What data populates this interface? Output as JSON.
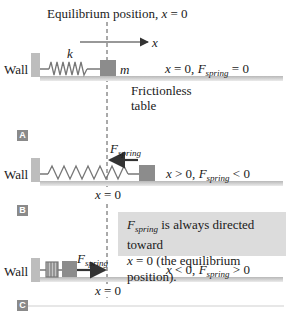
{
  "title": "Equilibrium position, x = 0",
  "title_parts": {
    "text": "Equilibrium position, ",
    "var": "x",
    "eq": " = 0"
  },
  "axis_label": "x",
  "panels": [
    {
      "id": "A",
      "spring_label": "k",
      "mass_label": "m",
      "wall_label": "Wall",
      "condition": {
        "lhs": "x",
        "lhs_rel": " = 0, ",
        "force": "F",
        "force_sub": "spring",
        "rhs": " = 0"
      },
      "table_label_line1": "Frictionless",
      "table_label_line2": "table"
    },
    {
      "id": "B",
      "wall_label": "Wall",
      "force_label": {
        "F": "F",
        "sub": "spring"
      },
      "condition": {
        "lhs": "x",
        "lhs_rel": " > 0, ",
        "force": "F",
        "force_sub": "spring",
        "rhs": " < 0"
      },
      "origin_label": {
        "var": "x",
        "eq": " = 0"
      }
    },
    {
      "id": "C",
      "wall_label": "Wall",
      "force_label": {
        "F": "F",
        "sub": "spring"
      },
      "condition": {
        "lhs": "x",
        "lhs_rel": " < 0, ",
        "force": "F",
        "force_sub": "spring",
        "rhs": " > 0"
      },
      "origin_label": {
        "var": "x",
        "eq": " = 0"
      }
    }
  ],
  "note": {
    "F": "F",
    "sub": "spring",
    "line1_rest": " is always directed toward",
    "line2_var": "x",
    "line2_rest": " = 0 (the equilibrium position)."
  },
  "colors": {
    "table": "#c8c8c8",
    "wall": "#bdbdbd",
    "block": "#8c8c8c",
    "spring": "#777777",
    "arrow": "#333333",
    "note_bg": "#dcdcdc",
    "label_bg": "#8a8a8a"
  }
}
